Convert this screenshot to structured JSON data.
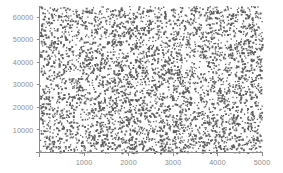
{
  "chart_data": {
    "type": "scatter",
    "title": "",
    "subtitle": "",
    "xlabel": "",
    "ylabel": "",
    "xlim": [
      0,
      5000
    ],
    "ylim": [
      0,
      65000
    ],
    "grid": false,
    "legend": null,
    "marker": {
      "color": "#5f5f5f",
      "size": 1.3,
      "shape": "square"
    },
    "n_points": 4200,
    "distribution": "uniform-random",
    "x_ticks": [
      1000,
      2000,
      3000,
      4000,
      5000
    ],
    "x_tick_labels": [
      "1000",
      "2000",
      "3000",
      "4000",
      "5000"
    ],
    "y_ticks": [
      10000,
      20000,
      30000,
      40000,
      50000,
      60000
    ],
    "y_tick_labels": [
      "10000",
      "20000",
      "30000",
      "40000",
      "50000",
      "60000"
    ],
    "axis_color": "#8a8a8a",
    "label_color": "#8d8d8d",
    "background_color": "#ffffff"
  },
  "plot_geometry": {
    "left": 39.5,
    "right": 262,
    "top": 6,
    "bottom": 152.5,
    "tick_length": 3
  }
}
